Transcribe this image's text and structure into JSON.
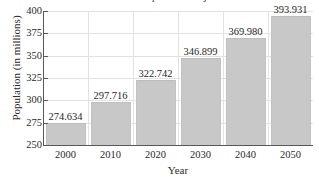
{
  "chart_data": {
    "type": "bar",
    "title": "U.S. Population Projections",
    "xlabel": "Year",
    "ylabel": "Population (in millions)",
    "categories": [
      "2000",
      "2010",
      "2020",
      "2030",
      "2040",
      "2050"
    ],
    "values": [
      274.634,
      297.716,
      322.742,
      346.899,
      369.98,
      393.931
    ],
    "value_labels": [
      "274.634",
      "297.716",
      "322.742",
      "346.899",
      "369.980",
      "393.931"
    ],
    "ylim": [
      250,
      400
    ],
    "ytick_values": [
      250,
      275,
      300,
      325,
      350,
      375,
      400
    ],
    "ytick_labels": [
      "250",
      "275",
      "300",
      "325",
      "350",
      "375",
      "400"
    ],
    "grid": true,
    "legend": false,
    "bar_color": "#c8c8c8",
    "grid_color": "#e2e2e2",
    "axis_color": "#585858",
    "text_color": "#2b2b2b"
  }
}
